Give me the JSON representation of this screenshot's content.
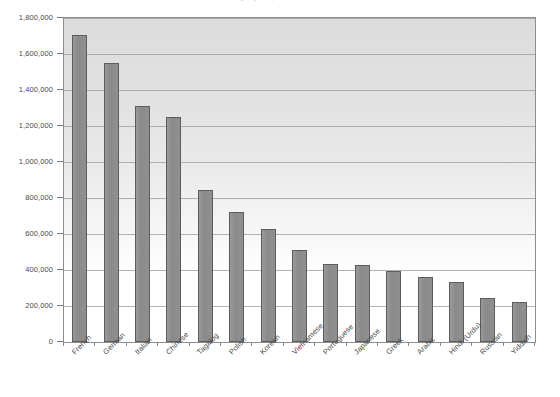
{
  "chart_data": {
    "type": "bar",
    "title": "Languages Spoken at Home",
    "xlabel": "",
    "ylabel": "",
    "ylim": [
      0,
      1800000
    ],
    "grid": true,
    "legend": "none",
    "orientation": "vertical",
    "categories": [
      "French",
      "German",
      "Italian",
      "Chinese",
      "Tagalog",
      "Polish",
      "Korean",
      "Vietnamese",
      "Portuguese",
      "Japanese",
      "Greek",
      "Arabic",
      "Hindi (Urdu)",
      "Russian",
      "Yiddish"
    ],
    "values": [
      1705000,
      1550000,
      1310000,
      1250000,
      845000,
      725000,
      630000,
      510000,
      435000,
      430000,
      395000,
      360000,
      335000,
      245000,
      220000
    ],
    "ytick_labels": [
      "0",
      "200,000",
      "400,000",
      "600,000",
      "800,000",
      "1,000,000",
      "1,200,000",
      "1,400,000",
      "1,600,000",
      "1,800,000"
    ],
    "ytick_values": [
      0,
      200000,
      400000,
      600000,
      800000,
      1000000,
      1200000,
      1400000,
      1600000,
      1800000
    ],
    "colors": {
      "bar_fill": "#8c8c8c",
      "bar_stroke": "#5c5c5c",
      "plot_border": "#8e8e8e",
      "gridline": "#9a9a9a",
      "plot_background_top": "#dcdcdc",
      "plot_background_bottom": "#ffffff",
      "text": "#4a4a4a"
    }
  }
}
